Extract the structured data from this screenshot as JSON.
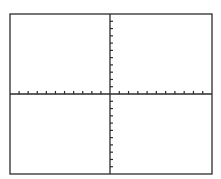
{
  "diagram": {
    "type": "blank coordinate grid",
    "frame": {
      "left": 10,
      "top": 14,
      "right": 212,
      "bottom": 174
    },
    "origin": {
      "x": 110,
      "y": 94
    },
    "x_axis": {
      "ticks_left": 10,
      "ticks_right": 10,
      "tick_side": "above",
      "tick_length": 3
    },
    "y_axis": {
      "ticks_up": 10,
      "ticks_down": 10,
      "tick_side": "right",
      "tick_length": 3
    },
    "colors": {
      "line": "#2b2b2b",
      "background": "#ffffff"
    }
  }
}
